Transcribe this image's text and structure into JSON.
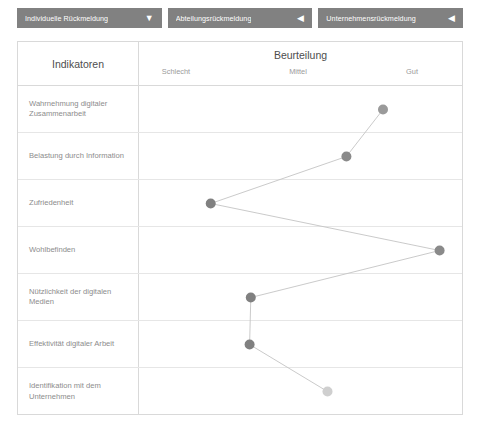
{
  "tabs": [
    {
      "label": "Individuelle Rückmeldung",
      "arrow": "▼",
      "arrow_icon": "chevron-down-icon",
      "state": "active"
    },
    {
      "label": "Abteilungsrückmeldung",
      "arrow": "◀",
      "arrow_icon": "chevron-left-icon",
      "state": "inactive"
    },
    {
      "label": "Unternehmensrückmeldung",
      "arrow": "◀",
      "arrow_icon": "chevron-left-icon",
      "state": "inactive"
    }
  ],
  "table": {
    "indicator_column_header": "Indikatoren",
    "rating_column_header": "Beurteilung",
    "scale_labels": [
      "Schlecht",
      "Mittel",
      "Gut"
    ]
  },
  "colors": {
    "tab_background": "#818181",
    "tab_text": "#ffffff",
    "table_border": "#d9d9d9",
    "row_separator": "#e6e6e6",
    "header_text": "#4d4d4d",
    "row_label_text": "#8c8c8c",
    "scale_label_text": "#9a9a9a",
    "line": "#c4c4c4",
    "dot_dark": "#8a8a8a",
    "dot_light": "#cfcfcf"
  },
  "chart_data": {
    "type": "line",
    "title": "Beurteilung",
    "xlabel": "",
    "ylabel": "Indikatoren",
    "orientation": "horizontal-categories-vertical-axis",
    "x_tick_labels": [
      "Schlecht",
      "Mittel",
      "Gut"
    ],
    "x_tick_values": [
      1,
      2,
      3
    ],
    "xlim": [
      0.6,
      3.4
    ],
    "grid": true,
    "legend": null,
    "categories": [
      "Wahrnehmung digitaler Zusammenarbeit",
      "Belastung durch Information",
      "Zufriedenheit",
      "Wohlbefinden",
      "Nützlichkeit der digitalen Medien",
      "Effektivität digitaler Arbeit",
      "Identifikation mit dem Unternehmen"
    ],
    "values": [
      2.72,
      2.41,
      1.26,
      3.2,
      1.6,
      1.59,
      2.25
    ],
    "points": [
      {
        "category": "Wahrnehmung digitaler Zusammenarbeit",
        "value": 2.72,
        "color": "#9a9a9a"
      },
      {
        "category": "Belastung durch Information",
        "value": 2.41,
        "color": "#8a8a8a"
      },
      {
        "category": "Zufriedenheit",
        "value": 1.26,
        "color": "#808080"
      },
      {
        "category": "Wohlbefinden",
        "value": 3.2,
        "color": "#8a8a8a"
      },
      {
        "category": "Nützlichkeit der digitalen Medien",
        "value": 1.6,
        "color": "#808080"
      },
      {
        "category": "Effektivität digitaler Arbeit",
        "value": 1.59,
        "color": "#808080"
      },
      {
        "category": "Identifikation mit dem Unternehmen",
        "value": 2.25,
        "color": "#cfcfcf"
      }
    ]
  }
}
